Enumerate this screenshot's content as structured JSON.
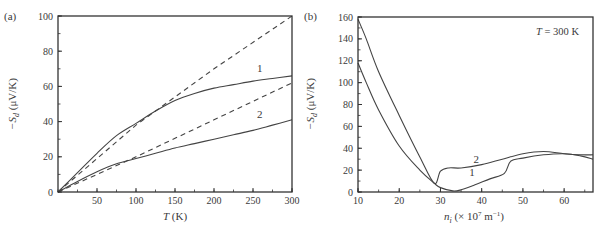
{
  "chart_data": [
    {
      "panel": "(a)",
      "type": "line",
      "title": "",
      "xlabel": "T (K)",
      "ylabel": "−S_d (μV/K)",
      "xlim": [
        0,
        300
      ],
      "ylim": [
        0,
        100
      ],
      "xticks": [
        50,
        100,
        150,
        200,
        250,
        300
      ],
      "yticks": [
        0,
        20,
        40,
        60,
        80,
        100
      ],
      "grid": false,
      "legend": "none (curves labeled inline 1 and 2)",
      "series": [
        {
          "name": "1",
          "style": "solid",
          "label_pos": [
            255,
            67
          ],
          "x": [
            0,
            25,
            50,
            75,
            100,
            125,
            150,
            175,
            200,
            225,
            250,
            275,
            300
          ],
          "y": [
            0,
            11,
            22,
            32,
            39,
            46,
            52,
            56,
            59,
            61,
            63,
            64.5,
            66
          ]
        },
        {
          "name": "1 (linear)",
          "style": "dashed",
          "x": [
            0,
            100,
            200,
            300
          ],
          "y": [
            0,
            38,
            70,
            100
          ]
        },
        {
          "name": "2",
          "style": "solid",
          "label_pos": [
            255,
            41
          ],
          "x": [
            0,
            25,
            50,
            75,
            100,
            125,
            150,
            175,
            200,
            225,
            250,
            275,
            300
          ],
          "y": [
            0,
            6,
            11.5,
            16,
            19,
            22,
            25,
            27.5,
            30,
            32.5,
            35,
            38,
            41
          ]
        },
        {
          "name": "2 (linear)",
          "style": "dashed",
          "x": [
            0,
            100,
            200,
            300
          ],
          "y": [
            0,
            20,
            41,
            62
          ]
        }
      ]
    },
    {
      "panel": "(b)",
      "type": "line",
      "title": "",
      "annotation": "T = 300 K",
      "xlabel": "n_i (× 10^7 m^-1)",
      "ylabel": "−S_d (μV/K)",
      "xlim": [
        10,
        67
      ],
      "ylim": [
        0,
        160
      ],
      "xticks": [
        10,
        20,
        30,
        40,
        50,
        60
      ],
      "yticks": [
        0,
        20,
        40,
        60,
        80,
        100,
        120,
        140,
        160
      ],
      "grid": false,
      "legend": "none (curves labeled inline 1 and 2)",
      "series": [
        {
          "name": "1",
          "style": "solid",
          "label_pos": [
            37,
            13
          ],
          "x": [
            10,
            12,
            15,
            20,
            25,
            28.5,
            30,
            33,
            35,
            38,
            42,
            45.5,
            47,
            50,
            55,
            60,
            64,
            67
          ],
          "y": [
            118,
            100,
            75,
            42,
            20,
            8,
            4,
            1,
            2,
            6,
            12,
            17,
            28,
            31,
            34,
            35,
            33,
            30
          ]
        },
        {
          "name": "2",
          "style": "solid",
          "label_pos": [
            38,
            25
          ],
          "x": [
            10,
            12,
            15,
            20,
            25,
            28.5,
            30,
            32,
            35,
            40,
            45,
            50,
            55,
            60,
            64,
            67
          ],
          "y": [
            158,
            140,
            110,
            70,
            32,
            8,
            19,
            22,
            22,
            25,
            30,
            35,
            37,
            35,
            34,
            34
          ]
        }
      ]
    }
  ],
  "figure": {
    "panel_a_label": "(a)",
    "panel_b_label": "(b)",
    "a_xlabel_italic": "T",
    "a_xlabel_unit": " (K)",
    "ylabel_prefix": "−S",
    "ylabel_sub": "d",
    "ylabel_unit": " (μV/K)",
    "b_xlabel_italic": "n",
    "b_xlabel_sub": "i",
    "b_xlabel_rest": " (× 10",
    "b_xlabel_sup": "7",
    "b_xlabel_unit": " m",
    "b_xlabel_sup2": "−1",
    "b_xlabel_close": ")",
    "b_annot_italic": "T",
    "b_annot_rest": " = 300 K",
    "curve_label_1": "1",
    "curve_label_2": "2"
  }
}
